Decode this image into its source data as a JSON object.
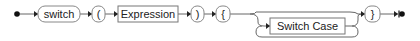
{
  "diagram": {
    "type": "railroad",
    "start_marker": "start-dot",
    "end_marker": "end-bar-dot",
    "nodes": [
      {
        "kind": "terminal",
        "label": "switch"
      },
      {
        "kind": "terminal",
        "label": "("
      },
      {
        "kind": "nonterminal",
        "label": "Expression"
      },
      {
        "kind": "terminal",
        "label": ")"
      },
      {
        "kind": "terminal",
        "label": "{"
      },
      {
        "kind": "nonterminal",
        "label": "Switch Case",
        "optional": true,
        "repeatable": true
      },
      {
        "kind": "terminal",
        "label": "}"
      }
    ],
    "colors": {
      "line": "#555555",
      "node_border": "#777777",
      "text": "#222222"
    }
  }
}
